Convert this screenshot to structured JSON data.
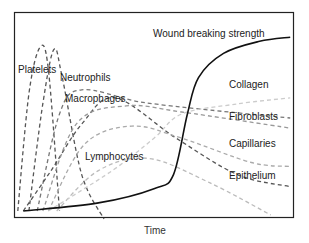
{
  "chart_data": {
    "type": "line",
    "title": "",
    "xlabel": "Time",
    "ylabel": "",
    "grid": false,
    "legend": "inline labels",
    "axis_ticks": "none",
    "x_range": [
      0,
      100
    ],
    "y_range": [
      0,
      100
    ],
    "series": [
      {
        "name": "Platelets",
        "style": "dashed",
        "color": "#555555",
        "points": [
          [
            1,
            2
          ],
          [
            5,
            60
          ],
          [
            9,
            83
          ],
          [
            12,
            72
          ],
          [
            16,
            2
          ]
        ]
      },
      {
        "name": "Neutrophils",
        "style": "dashed",
        "color": "#555555",
        "points": [
          [
            5,
            2
          ],
          [
            10,
            55
          ],
          [
            14,
            82
          ],
          [
            17,
            68
          ],
          [
            24,
            20
          ],
          [
            32,
            -2
          ]
        ]
      },
      {
        "name": "Macrophages",
        "style": "dashed",
        "color": "#777777",
        "points": [
          [
            8,
            2
          ],
          [
            16,
            50
          ],
          [
            24,
            62
          ],
          [
            45,
            56
          ],
          [
            70,
            52
          ],
          [
            99,
            48
          ]
        ]
      },
      {
        "name": "Lymphocytes",
        "style": "dashed",
        "color": "#555555",
        "points": [
          [
            3,
            2
          ],
          [
            13,
            22
          ],
          [
            24,
            45
          ],
          [
            36,
            58
          ],
          [
            58,
            38
          ],
          [
            80,
            20
          ],
          [
            99,
            14
          ]
        ]
      },
      {
        "name": "Fibroblasts",
        "style": "dashed",
        "color": "#999999",
        "points": [
          [
            10,
            2
          ],
          [
            22,
            45
          ],
          [
            40,
            54
          ],
          [
            60,
            51
          ],
          [
            99,
            43
          ]
        ]
      },
      {
        "name": "Capillaries",
        "style": "dashed",
        "color": "#aaaaaa",
        "points": [
          [
            12,
            2
          ],
          [
            25,
            35
          ],
          [
            42,
            44
          ],
          [
            60,
            38
          ],
          [
            85,
            26
          ],
          [
            99,
            24
          ]
        ]
      },
      {
        "name": "Epithelium",
        "style": "dashed",
        "color": "#bbbbbb",
        "points": [
          [
            15,
            2
          ],
          [
            30,
            22
          ],
          [
            48,
            28
          ],
          [
            70,
            16
          ],
          [
            92,
            0
          ]
        ]
      },
      {
        "name": "Collagen",
        "style": "dashed",
        "color": "#cccccc",
        "points": [
          [
            12,
            2
          ],
          [
            35,
            22
          ],
          [
            50,
            38
          ],
          [
            60,
            50
          ],
          [
            80,
            55
          ],
          [
            99,
            58
          ]
        ]
      },
      {
        "name": "Wound breaking strength",
        "style": "solid",
        "color": "#111111",
        "points": [
          [
            3,
            2
          ],
          [
            30,
            6
          ],
          [
            50,
            13
          ],
          [
            57,
            20
          ],
          [
            62,
            50
          ],
          [
            66,
            68
          ],
          [
            75,
            80
          ],
          [
            88,
            86
          ],
          [
            99,
            88
          ]
        ]
      }
    ]
  },
  "labels": {
    "wound": "Wound breaking strength",
    "collagen": "Collagen",
    "fibroblasts": "Fibroblasts",
    "capillaries": "Capillaries",
    "epithelium": "Epithelium",
    "platelets": "Platelets",
    "neutrophils": "Neutrophils",
    "macrophages": "Macrophages",
    "lymphocytes": "Lymphocytes",
    "xlabel": "Time"
  }
}
